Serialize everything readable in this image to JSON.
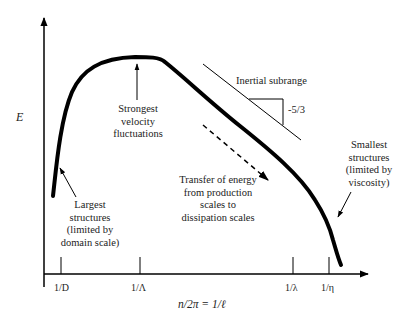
{
  "diagram": {
    "y_axis_label": "E",
    "x_axis_label": "n/2π = 1/ℓ",
    "x_ticks": [
      "1/D",
      "1/Λ",
      "1/λ",
      "1/η"
    ],
    "annotations": {
      "strongest": [
        "Strongest",
        "velocity",
        "fluctuations"
      ],
      "inertial": "Inertial subrange",
      "slope": "-5/3",
      "transfer": [
        "Transfer of energy",
        "from production",
        "scales to",
        "dissipation scales"
      ],
      "largest": [
        "Largest",
        "structures",
        "(limited by",
        "domain scale)"
      ],
      "smallest": [
        "Smallest",
        "structures",
        "(limited by",
        "viscosity)"
      ]
    },
    "colors": {
      "line": "#000000",
      "text": "#222222",
      "background": "#ffffff"
    }
  }
}
